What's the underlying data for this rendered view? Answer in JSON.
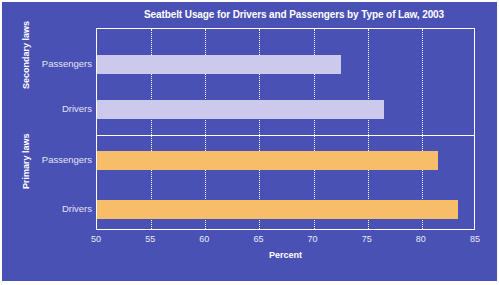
{
  "chart_data": {
    "type": "bar",
    "orientation": "horizontal",
    "title": "Seatbelt Usage for Drivers and Passengers by Type of Law, 2003",
    "xlabel": "Percent",
    "ylabel": "",
    "xlim": [
      50,
      85
    ],
    "xticks": [
      50,
      55,
      60,
      65,
      70,
      75,
      80,
      85
    ],
    "grid": "vertical-dotted",
    "legend": "none",
    "groups": [
      {
        "name": "Secondary laws",
        "color": "#cdc9ed",
        "categories": [
          "Passengers",
          "Drivers"
        ],
        "values": [
          72.5,
          76.5
        ]
      },
      {
        "name": "Primary laws",
        "color": "#f7bd68",
        "categories": [
          "Passengers",
          "Drivers"
        ],
        "values": [
          81.5,
          83.3
        ]
      }
    ],
    "bars": [
      {
        "group": "Secondary laws",
        "category": "Passengers",
        "value": 72.5,
        "color": "#cdc9ed"
      },
      {
        "group": "Secondary laws",
        "category": "Drivers",
        "value": 76.5,
        "color": "#cdc9ed"
      },
      {
        "group": "Primary laws",
        "category": "Passengers",
        "value": 81.5,
        "color": "#f7bd68"
      },
      {
        "group": "Primary laws",
        "category": "Drivers",
        "value": 83.3,
        "color": "#f7bd68"
      }
    ],
    "colors": {
      "background": "#4a51b5",
      "secondary_bar": "#cdc9ed",
      "primary_bar": "#f7bd68",
      "axis_text": "#e9e9f7",
      "title_text": "#ffffff",
      "grid": "#ffffff"
    }
  }
}
